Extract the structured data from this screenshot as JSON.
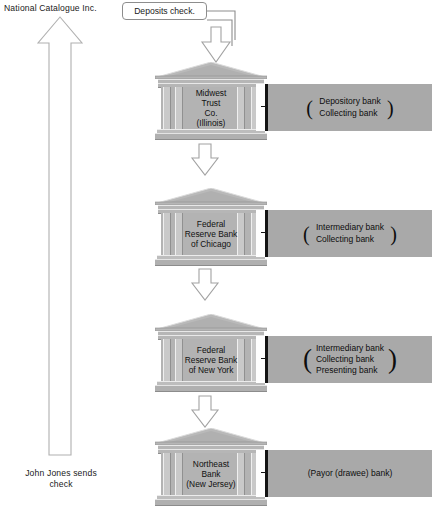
{
  "diagram": {
    "title_note": "check collection flow",
    "origin_label": "National Catalogue Inc.",
    "sender_label": "John Jones\nsends check",
    "callout": {
      "text": "Deposits check."
    },
    "return_arrow": {
      "name": "upward-return-arrow",
      "direction": "up"
    },
    "flow_arrows": [
      {
        "direction": "down",
        "name": "deposit-arrow"
      },
      {
        "direction": "down",
        "name": "forward-arrow-1"
      },
      {
        "direction": "down",
        "name": "forward-arrow-2"
      },
      {
        "direction": "down",
        "name": "forward-arrow-3"
      }
    ],
    "colors": {
      "panel_gray": "#a9a9a9",
      "building_gray": "#b3b3b3",
      "column_gray": "#c9c9c9",
      "bracket_black": "#141414",
      "outline_gray": "#9a9a9a",
      "text": "#1a1a1a"
    },
    "banks": [
      {
        "name": "Midwest\nTrust\nCo.\n(Illinois)",
        "roles": "Depository bank\nCollecting bank",
        "role_lines": 2
      },
      {
        "name": "Federal\nReserve Bank\nof Chicago",
        "roles": "Intermediary bank\nCollecting bank",
        "role_lines": 2
      },
      {
        "name": "Federal\nReserve Bank\nof New York",
        "roles": "Intermediary bank\nCollecting bank\nPresenting bank",
        "role_lines": 3
      },
      {
        "name": "Northeast\nBank\n(New Jersey)",
        "roles": "(Payor (drawee) bank)",
        "role_lines": 1
      }
    ]
  }
}
